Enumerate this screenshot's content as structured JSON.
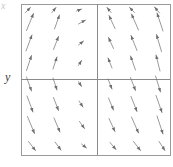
{
  "figure": {
    "kind": "slope-field",
    "background": "#ffffff",
    "frame": {
      "x0": 21,
      "y0": 4,
      "x1": 170,
      "y1": 155,
      "color": "#9a9a9a",
      "width": 1
    },
    "axes": {
      "x_axis_y": 79,
      "y_axis_x": 97,
      "color": "#8a8a8a",
      "width": 1
    },
    "labels": {
      "y_label": "y",
      "corner_mark": "x"
    },
    "arrow_style": {
      "color": "#6e6e6e",
      "width": 0.7,
      "head_length": 3.4,
      "head_width": 2.1
    }
  },
  "chart_data": {
    "type": "scatter",
    "title": "",
    "xlabel": "",
    "ylabel": "y",
    "grid": false,
    "legend": null,
    "xlim": [
      -3,
      3
    ],
    "ylim": [
      -3,
      3
    ],
    "grid_x": [
      -2.5,
      -1.5,
      -0.5,
      0.5,
      1.5,
      2.5
    ],
    "grid_y": [
      2.6,
      1.8,
      1.0,
      0.3,
      -0.4,
      -1.2,
      -2.0,
      -2.8
    ],
    "arrows": [
      {
        "x": 30,
        "y": 22,
        "dx": 7,
        "dy": -17
      },
      {
        "x": 57,
        "y": 22,
        "dx": 5,
        "dy": -14
      },
      {
        "x": 82,
        "y": 22,
        "dx": 7,
        "dy": -4
      },
      {
        "x": 112,
        "y": 22,
        "dx": -6,
        "dy": -13
      },
      {
        "x": 135,
        "y": 22,
        "dx": -7,
        "dy": -16
      },
      {
        "x": 160,
        "y": 22,
        "dx": -6,
        "dy": -18
      },
      {
        "x": 29,
        "y": 43,
        "dx": 6,
        "dy": -16
      },
      {
        "x": 56,
        "y": 43,
        "dx": 5,
        "dy": -13
      },
      {
        "x": 81,
        "y": 43,
        "dx": 5,
        "dy": -4
      },
      {
        "x": 111,
        "y": 43,
        "dx": -5,
        "dy": -11
      },
      {
        "x": 134,
        "y": 43,
        "dx": -6,
        "dy": -15
      },
      {
        "x": 159,
        "y": 43,
        "dx": -5,
        "dy": -17
      },
      {
        "x": 29,
        "y": 63,
        "dx": 5,
        "dy": -15
      },
      {
        "x": 55,
        "y": 63,
        "dx": 4,
        "dy": -12
      },
      {
        "x": 80,
        "y": 63,
        "dx": 3,
        "dy": -5
      },
      {
        "x": 110,
        "y": 63,
        "dx": -4,
        "dy": -10
      },
      {
        "x": 133,
        "y": 63,
        "dx": -5,
        "dy": -14
      },
      {
        "x": 158,
        "y": 63,
        "dx": -4,
        "dy": -16
      },
      {
        "x": 29,
        "y": 84,
        "dx": 5,
        "dy": 14
      },
      {
        "x": 55,
        "y": 84,
        "dx": 4,
        "dy": 12
      },
      {
        "x": 80,
        "y": 84,
        "dx": 3,
        "dy": 5
      },
      {
        "x": 110,
        "y": 84,
        "dx": 4,
        "dy": 10
      },
      {
        "x": 133,
        "y": 84,
        "dx": 5,
        "dy": 13
      },
      {
        "x": 158,
        "y": 84,
        "dx": 5,
        "dy": 16
      },
      {
        "x": 30,
        "y": 104,
        "dx": 6,
        "dy": 16
      },
      {
        "x": 56,
        "y": 104,
        "dx": 5,
        "dy": 13
      },
      {
        "x": 81,
        "y": 104,
        "dx": 4,
        "dy": 6
      },
      {
        "x": 111,
        "y": 104,
        "dx": 5,
        "dy": 12
      },
      {
        "x": 134,
        "y": 104,
        "dx": 6,
        "dy": 15
      },
      {
        "x": 159,
        "y": 104,
        "dx": 6,
        "dy": 17
      },
      {
        "x": 31,
        "y": 125,
        "dx": 7,
        "dy": 17
      },
      {
        "x": 57,
        "y": 125,
        "dx": 6,
        "dy": 14
      },
      {
        "x": 82,
        "y": 125,
        "dx": 5,
        "dy": 7
      },
      {
        "x": 112,
        "y": 125,
        "dx": 6,
        "dy": 13
      },
      {
        "x": 135,
        "y": 125,
        "dx": 7,
        "dy": 16
      },
      {
        "x": 160,
        "y": 125,
        "dx": 6,
        "dy": 18
      },
      {
        "x": 32,
        "y": 146,
        "dx": 7,
        "dy": 9
      },
      {
        "x": 58,
        "y": 146,
        "dx": 6,
        "dy": 8
      },
      {
        "x": 84,
        "y": 146,
        "dx": 5,
        "dy": 4
      },
      {
        "x": 113,
        "y": 146,
        "dx": 6,
        "dy": 7
      },
      {
        "x": 137,
        "y": 146,
        "dx": 7,
        "dy": 9
      },
      {
        "x": 162,
        "y": 146,
        "dx": 6,
        "dy": 9
      },
      {
        "x": 28,
        "y": 10,
        "dx": 5,
        "dy": -5
      },
      {
        "x": 54,
        "y": 10,
        "dx": 4,
        "dy": -5
      },
      {
        "x": 79,
        "y": 10,
        "dx": 5,
        "dy": -2
      },
      {
        "x": 109,
        "y": 10,
        "dx": -4,
        "dy": -5
      },
      {
        "x": 132,
        "y": 10,
        "dx": -5,
        "dy": -5
      },
      {
        "x": 157,
        "y": 10,
        "dx": -5,
        "dy": -6
      }
    ]
  }
}
